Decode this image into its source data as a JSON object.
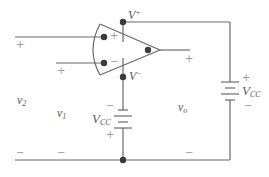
{
  "diagram": {
    "type": "op-amp circuit with dual supply",
    "colors": {
      "wire": "#6a6a6a",
      "node": "#3a3a3a",
      "label": "#5a5a5a",
      "faint_sign": "#9a9a9a"
    },
    "op_amp": {
      "input_plus_label": "+",
      "input_minus_label": "−",
      "supply_plus_label": "V",
      "supply_plus_sup": "+",
      "supply_minus_label": "V",
      "supply_minus_sup": "−"
    },
    "voltages": {
      "v2": {
        "main": "v",
        "sub": "2",
        "plus": "+",
        "minus": "−"
      },
      "v1": {
        "main": "v",
        "sub": "1",
        "plus": "+",
        "minus": "−"
      },
      "vo": {
        "main": "v",
        "sub": "o",
        "plus": "+",
        "minus": "−"
      }
    },
    "batteries": [
      {
        "id": "left",
        "label_main": "V",
        "label_sub": "CC",
        "top_sign": "−",
        "bottom_sign": "+"
      },
      {
        "id": "right",
        "label_main": "V",
        "label_sub": "CC",
        "top_sign": "+",
        "bottom_sign": "−"
      }
    ]
  }
}
